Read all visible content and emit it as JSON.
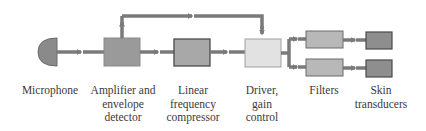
{
  "diagram": {
    "title": "",
    "colors": {
      "arrow": "#7a7a7a",
      "microphone": "#8a8a8a",
      "amplifier": "#9a9a9a",
      "compressor": "#a8a8a8",
      "driver": "#e2e2e2",
      "filters": "#b8b8b8",
      "transducers": "#8e8e8e",
      "border": "#5a5a5a"
    },
    "nodes": [
      {
        "id": "microphone",
        "label": "Microphone"
      },
      {
        "id": "amplifier",
        "label_lines": [
          "Amplifier and",
          "envelope",
          "detector"
        ]
      },
      {
        "id": "compressor",
        "label_lines": [
          "Linear",
          "frequency",
          "compressor"
        ]
      },
      {
        "id": "driver",
        "label_lines": [
          "Driver,",
          "gain",
          "control"
        ]
      },
      {
        "id": "filters",
        "label": "Filters"
      },
      {
        "id": "transducers",
        "label_lines": [
          "Skin",
          "transducers"
        ]
      }
    ],
    "edges": [
      {
        "from": "microphone",
        "to": "amplifier"
      },
      {
        "from": "amplifier",
        "to": "compressor"
      },
      {
        "from": "amplifier",
        "to": "driver",
        "route": "top-bypass"
      },
      {
        "from": "compressor",
        "to": "driver"
      },
      {
        "from": "driver",
        "to": "filters",
        "count": 2
      },
      {
        "from": "filters",
        "to": "transducers",
        "count": 2
      }
    ]
  }
}
